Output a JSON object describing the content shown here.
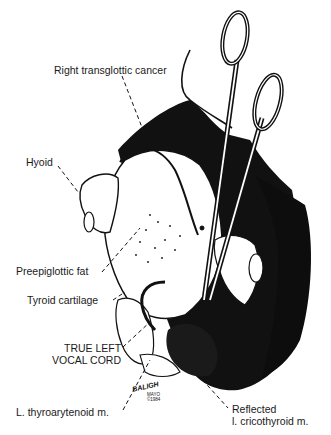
{
  "figure": {
    "labels": {
      "right_transglottic_cancer": "Right transglottic cancer",
      "hyoid": "Hyoid",
      "preepiglottic_fat": "Preepiglottic fat",
      "tyroid_cartilage": "Tyroid cartilage",
      "true_left_vocal_cord_line1": "TRUE LEFT",
      "true_left_vocal_cord_line2": "VOCAL CORD",
      "thyroarytenoid": "L. thyroarytenoid m.",
      "reflected_line1": "Reflected",
      "reflected_line2": "l. cricothyroid m."
    },
    "signature": {
      "artist": "BALIGH",
      "institution": "MAYO",
      "year": "©1984"
    },
    "colors": {
      "ink": "#111111",
      "paper": "#ffffff"
    }
  }
}
